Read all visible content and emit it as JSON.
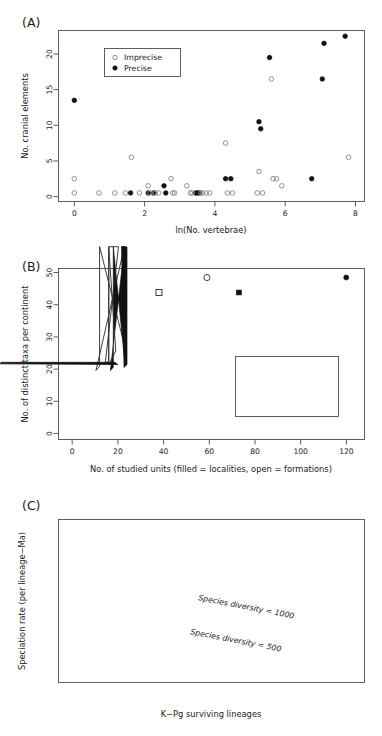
{
  "figure": {
    "panels": [
      {
        "tag": "(A)",
        "xlabel": "ln(No. vertebrae)",
        "ylabel": "No. cranial elements",
        "xticks": [
          "0",
          "2",
          "4",
          "6",
          "8"
        ],
        "yticks": [
          "0",
          "5",
          "10",
          "15",
          "20"
        ],
        "legend": [
          {
            "label": "Imprecise",
            "marker": "open-circle-icon"
          },
          {
            "label": "Precise",
            "marker": "filled-circle-icon"
          }
        ]
      },
      {
        "tag": "(B)",
        "xlabel": "No. of studied units (filled = localities, open = formations)",
        "ylabel": "No. of distinct taxa per continent",
        "xticks": [
          "0",
          "20",
          "40",
          "60",
          "80",
          "100",
          "120"
        ],
        "yticks": [
          "0",
          "10",
          "20",
          "30",
          "40",
          "50"
        ],
        "legend": [
          {
            "label": "Europe",
            "marker": "open-circle-icon"
          },
          {
            "label": "North America",
            "marker": "open-square-icon"
          },
          {
            "label": "South America",
            "marker": "open-diamond-icon"
          },
          {
            "label": "Africa",
            "marker": "open-triangle-up-icon"
          },
          {
            "label": "Asia",
            "marker": "open-triangle-down-icon"
          },
          {
            "label": "Australia",
            "marker": "open-star-icon"
          }
        ]
      },
      {
        "tag": "(C)",
        "xlabel": "K−Pg surviving lineages",
        "ylabel": "Speciation rate (per lineage−Ma)",
        "xticks": [
          "0",
          "50",
          "100",
          "150",
          "200"
        ],
        "yticks": [
          "0.00",
          "0.02",
          "0.04",
          "0.06",
          "0.08",
          "0.10",
          "0.12"
        ],
        "annotations": [
          {
            "text": "Species diversity = 1000"
          },
          {
            "text": "Species diversity = 500"
          }
        ]
      }
    ]
  },
  "chart_data": [
    {
      "type": "scatter",
      "title": "(A)",
      "xlabel": "ln(No. vertebrae)",
      "ylabel": "No. cranial elements",
      "xlim": [
        -0.45,
        8.25
      ],
      "ylim": [
        -1.2,
        22.8
      ],
      "xticks": [
        0,
        2,
        4,
        6,
        8
      ],
      "yticks": [
        0,
        5,
        10,
        15,
        20
      ],
      "grid": false,
      "legend_position": "top-left-inside",
      "series": [
        {
          "name": "Precise",
          "marker": "filled-circle",
          "points": [
            [
              0.0,
              13
            ],
            [
              1.6,
              0
            ],
            [
              2.1,
              0
            ],
            [
              2.25,
              0
            ],
            [
              2.55,
              1
            ],
            [
              2.6,
              0
            ],
            [
              3.45,
              0
            ],
            [
              3.5,
              0
            ],
            [
              3.55,
              0
            ],
            [
              4.3,
              2
            ],
            [
              4.45,
              2
            ],
            [
              5.25,
              10
            ],
            [
              5.3,
              9
            ],
            [
              5.55,
              19
            ],
            [
              6.75,
              2
            ],
            [
              7.1,
              21
            ],
            [
              7.05,
              16
            ],
            [
              7.7,
              22
            ]
          ]
        },
        {
          "name": "Imprecise",
          "marker": "open-circle",
          "points": [
            [
              0.0,
              2
            ],
            [
              0.0,
              0
            ],
            [
              0.7,
              0
            ],
            [
              1.15,
              0
            ],
            [
              1.45,
              0
            ],
            [
              1.62,
              5
            ],
            [
              1.85,
              0
            ],
            [
              2.1,
              1
            ],
            [
              2.15,
              0
            ],
            [
              2.3,
              0
            ],
            [
              2.4,
              0
            ],
            [
              2.75,
              2
            ],
            [
              2.8,
              0
            ],
            [
              2.85,
              0
            ],
            [
              3.2,
              1
            ],
            [
              3.3,
              0
            ],
            [
              3.35,
              0
            ],
            [
              3.6,
              0
            ],
            [
              3.65,
              0
            ],
            [
              3.75,
              0
            ],
            [
              3.85,
              0
            ],
            [
              4.3,
              7
            ],
            [
              4.35,
              0
            ],
            [
              4.5,
              0
            ],
            [
              5.25,
              3
            ],
            [
              5.2,
              0
            ],
            [
              5.35,
              0
            ],
            [
              5.6,
              16
            ],
            [
              5.65,
              2
            ],
            [
              5.75,
              2
            ],
            [
              5.9,
              1
            ],
            [
              7.8,
              5
            ]
          ]
        }
      ]
    },
    {
      "type": "scatter",
      "title": "(B)",
      "xlabel": "No. of studied units (filled = localities, open = formations)",
      "ylabel": "No. of distinct taxa per continent",
      "xlim": [
        -6,
        128
      ],
      "ylim": [
        -3,
        54
      ],
      "xticks": [
        0,
        20,
        40,
        60,
        80,
        100,
        120
      ],
      "yticks": [
        0,
        10,
        20,
        30,
        40,
        50
      ],
      "grid": false,
      "legend_position": "right-middle-inside",
      "note": "filled = localities, open = formations",
      "series": [
        {
          "name": "Europe",
          "marker": "circle",
          "points": [
            {
              "x": 59,
              "y": 51,
              "fill": "open"
            },
            {
              "x": 120,
              "y": 51,
              "fill": "filled"
            }
          ]
        },
        {
          "name": "North America",
          "marker": "square",
          "points": [
            {
              "x": 38,
              "y": 46,
              "fill": "open"
            },
            {
              "x": 73,
              "y": 46,
              "fill": "filled"
            }
          ]
        },
        {
          "name": "South America",
          "marker": "diamond",
          "points": [
            {
              "x": 12,
              "y": 20,
              "fill": "open"
            },
            {
              "x": 18,
              "y": 20,
              "fill": "filled"
            }
          ]
        },
        {
          "name": "Africa",
          "marker": "triangle-up",
          "points": [
            {
              "x": 16,
              "y": 22,
              "fill": "open"
            },
            {
              "x": 24,
              "y": 21,
              "fill": "filled"
            }
          ]
        },
        {
          "name": "Asia",
          "marker": "triangle-down",
          "points": [
            {
              "x": 16,
              "y": 22,
              "fill": "open"
            },
            {
              "x": 20,
              "y": 22,
              "fill": "filled"
            }
          ]
        },
        {
          "name": "Australia",
          "marker": "star",
          "points": [
            {
              "x": 2,
              "y": 4,
              "fill": "open"
            },
            {
              "x": 3,
              "y": 4,
              "fill": "filled"
            }
          ]
        }
      ]
    },
    {
      "type": "line",
      "title": "(C)",
      "xlabel": "K−Pg surviving lineages",
      "ylabel": "Speciation rate (per lineage−Ma)",
      "xlim": [
        0,
        208
      ],
      "ylim": [
        0.0,
        0.125
      ],
      "xticks": [
        0,
        50,
        100,
        150,
        200
      ],
      "yticks": [
        0.0,
        0.02,
        0.04,
        0.06,
        0.08,
        0.1,
        0.12
      ],
      "grid": false,
      "series": [
        {
          "name": "Species diversity = 1000",
          "x": [
            4,
            10,
            20,
            30,
            40,
            50,
            60,
            70,
            80,
            90,
            100,
            120,
            140,
            160,
            180,
            200,
            207
          ],
          "y": [
            0.12,
            0.113,
            0.0985,
            0.0885,
            0.0805,
            0.074,
            0.0688,
            0.0645,
            0.0608,
            0.0576,
            0.0548,
            0.05,
            0.0461,
            0.0428,
            0.04,
            0.0376,
            0.0369
          ]
        },
        {
          "name": "Species diversity = 500",
          "x": [
            7,
            10,
            20,
            30,
            40,
            50,
            60,
            70,
            80,
            90,
            100,
            120,
            140,
            160,
            180,
            200,
            207
          ],
          "y": [
            0.12,
            0.1085,
            0.0862,
            0.073,
            0.0638,
            0.057,
            0.0516,
            0.0473,
            0.0438,
            0.0408,
            0.0382,
            0.034,
            0.0306,
            0.028,
            0.0257,
            0.0238,
            0.0232
          ]
        }
      ]
    }
  ]
}
